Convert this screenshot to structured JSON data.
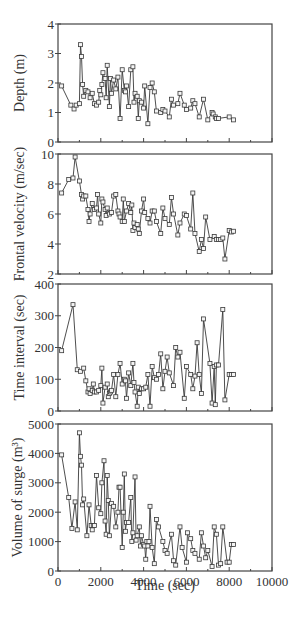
{
  "chart_data": [
    {
      "type": "line",
      "title": "",
      "xlabel": "",
      "ylabel": "Depth (m)",
      "xlim": [
        0,
        10000
      ],
      "ylim": [
        0,
        4
      ],
      "yticks": [
        0,
        1,
        2,
        3,
        4
      ],
      "grid": false,
      "marker": "square",
      "x": [
        170,
        600,
        750,
        850,
        1000,
        1050,
        1100,
        1150,
        1200,
        1300,
        1400,
        1500,
        1600,
        1700,
        1800,
        1900,
        1950,
        2000,
        2050,
        2100,
        2200,
        2250,
        2300,
        2400,
        2450,
        2500,
        2600,
        2700,
        2800,
        2900,
        3000,
        3100,
        3150,
        3200,
        3300,
        3400,
        3500,
        3550,
        3600,
        3700,
        3750,
        3800,
        3900,
        4000,
        4050,
        4200,
        4300,
        4400,
        4500,
        4600,
        4800,
        4900,
        5000,
        5200,
        5300,
        5400,
        5600,
        5700,
        5900,
        6000,
        6200,
        6300,
        6400,
        6600,
        6800,
        7000,
        7200,
        7250,
        7350,
        7400,
        7500,
        8000,
        8200
      ],
      "values": [
        1.9,
        1.25,
        1.12,
        1.25,
        1.3,
        3.3,
        2.9,
        1.95,
        1.55,
        1.75,
        1.7,
        1.5,
        1.65,
        1.3,
        1.25,
        1.35,
        1.75,
        1.6,
        1.95,
        2.35,
        2.15,
        1.5,
        2.6,
        1.2,
        2.15,
        1.65,
        2.1,
        1.8,
        2.2,
        0.8,
        2.45,
        1.75,
        1.7,
        1.9,
        1.2,
        2.45,
        2.55,
        1.35,
        1.65,
        1.55,
        0.8,
        1.4,
        1.35,
        1.15,
        1.9,
        0.62,
        1.85,
        2.0,
        1.7,
        1.05,
        1.0,
        1.1,
        1.05,
        0.85,
        1.45,
        1.25,
        1.3,
        1.65,
        1.25,
        1.1,
        1.15,
        1.4,
        1.3,
        0.85,
        1.45,
        0.75,
        1.0,
        0.95,
        0.85,
        0.8,
        0.8,
        0.85,
        0.75
      ]
    },
    {
      "type": "line",
      "xlabel": "",
      "ylabel": "Frontal velocity (m/sec)",
      "xlim": [
        0,
        10000
      ],
      "ylim": [
        2,
        10
      ],
      "yticks": [
        2,
        4,
        6,
        8,
        10
      ],
      "grid": false,
      "marker": "square",
      "x": [
        170,
        500,
        700,
        800,
        1000,
        1100,
        1150,
        1200,
        1300,
        1400,
        1450,
        1500,
        1600,
        1700,
        1800,
        1850,
        1900,
        2000,
        2050,
        2100,
        2200,
        2250,
        2300,
        2400,
        2500,
        2600,
        2700,
        2800,
        2850,
        2900,
        3000,
        3050,
        3100,
        3200,
        3300,
        3400,
        3450,
        3500,
        3550,
        3600,
        3700,
        3750,
        3800,
        3900,
        4000,
        4050,
        4200,
        4300,
        4400,
        4500,
        4600,
        4800,
        4900,
        5000,
        5200,
        5300,
        5400,
        5600,
        5700,
        5900,
        6000,
        6200,
        6300,
        6400,
        6600,
        6700,
        6800,
        6900,
        7100,
        7300,
        7400,
        7500,
        7600,
        7700,
        7800,
        8000,
        8100,
        8200
      ],
      "values": [
        7.4,
        8.3,
        8.4,
        9.8,
        8.2,
        7.3,
        7.0,
        7.2,
        7.2,
        6.3,
        5.5,
        6.0,
        6.7,
        6.3,
        6.4,
        7.3,
        6.0,
        5.4,
        7.0,
        6.8,
        6.3,
        5.9,
        6.4,
        6.0,
        6.1,
        7.2,
        7.3,
        6.2,
        6.0,
        5.8,
        5.5,
        7.0,
        5.5,
        6.2,
        6.7,
        6.1,
        6.6,
        4.9,
        5.4,
        5.1,
        5.3,
        5.0,
        4.7,
        6.2,
        7.0,
        6.1,
        5.7,
        5.4,
        6.2,
        6.2,
        5.5,
        4.7,
        6.4,
        5.7,
        5.3,
        7.1,
        6.0,
        4.6,
        5.4,
        6.0,
        5.9,
        5.0,
        7.4,
        4.7,
        3.5,
        4.3,
        3.7,
        5.8,
        4.3,
        4.5,
        4.3,
        4.3,
        4.3,
        4.4,
        3.0,
        4.9,
        4.8,
        4.85
      ]
    },
    {
      "type": "line",
      "xlabel": "",
      "ylabel": "Time interval (sec)",
      "xlim": [
        0,
        10000
      ],
      "ylim": [
        0,
        400
      ],
      "yticks": [
        0,
        100,
        200,
        300,
        400
      ],
      "grid": false,
      "marker": "square",
      "x": [
        170,
        700,
        900,
        1050,
        1200,
        1300,
        1400,
        1450,
        1500,
        1600,
        1650,
        1700,
        1800,
        1900,
        2000,
        2050,
        2100,
        2200,
        2300,
        2350,
        2400,
        2450,
        2500,
        2600,
        2700,
        2800,
        2900,
        3000,
        3100,
        3150,
        3200,
        3300,
        3400,
        3500,
        3550,
        3600,
        3700,
        3750,
        3800,
        3900,
        4000,
        4100,
        4200,
        4300,
        4400,
        4500,
        4600,
        4700,
        4800,
        4900,
        5000,
        5100,
        5200,
        5400,
        5500,
        5600,
        5700,
        5900,
        6000,
        6200,
        6300,
        6400,
        6500,
        6600,
        6700,
        6800,
        7100,
        7200,
        7300,
        7350,
        7400,
        7500,
        7700,
        7800,
        8000,
        8100,
        8200
      ],
      "values": [
        190,
        335,
        130,
        125,
        135,
        95,
        60,
        70,
        55,
        65,
        85,
        60,
        60,
        65,
        80,
        135,
        25,
        75,
        85,
        45,
        55,
        60,
        65,
        115,
        45,
        115,
        150,
        85,
        100,
        95,
        40,
        120,
        80,
        150,
        90,
        60,
        15,
        75,
        55,
        70,
        70,
        75,
        115,
        15,
        140,
        105,
        100,
        115,
        180,
        70,
        125,
        170,
        120,
        80,
        200,
        170,
        185,
        40,
        140,
        115,
        70,
        110,
        215,
        115,
        55,
        290,
        150,
        25,
        140,
        20,
        145,
        145,
        320,
        35,
        115,
        115,
        115
      ]
    },
    {
      "type": "line",
      "xlabel": "Time (sec)",
      "ylabel": "Volume of surge (m³)",
      "xlim": [
        0,
        10000
      ],
      "xticks": [
        0,
        2000,
        4000,
        6000,
        8000,
        10000
      ],
      "ylim": [
        0,
        5000
      ],
      "yticks": [
        0,
        1000,
        2000,
        3000,
        4000,
        5000
      ],
      "grid": false,
      "marker": "square",
      "x": [
        170,
        500,
        650,
        800,
        900,
        1000,
        1050,
        1100,
        1150,
        1200,
        1350,
        1450,
        1550,
        1600,
        1650,
        1700,
        1800,
        1900,
        2000,
        2050,
        2150,
        2200,
        2250,
        2300,
        2350,
        2400,
        2500,
        2600,
        2700,
        2800,
        2850,
        2900,
        3000,
        3050,
        3100,
        3150,
        3200,
        3300,
        3400,
        3450,
        3500,
        3600,
        3650,
        3700,
        3800,
        3850,
        3900,
        4000,
        4050,
        4100,
        4150,
        4200,
        4250,
        4300,
        4400,
        4500,
        4600,
        4700,
        4900,
        5000,
        5100,
        5300,
        5400,
        5500,
        5700,
        5800,
        6000,
        6050,
        6200,
        6300,
        6400,
        6600,
        6700,
        6800,
        6900,
        7000,
        7200,
        7300,
        7400,
        7500,
        7600,
        7700,
        7900,
        8000,
        8100,
        8200
      ],
      "values": [
        3950,
        2500,
        1450,
        2350,
        1400,
        4700,
        3900,
        3600,
        2250,
        2450,
        1200,
        2250,
        1550,
        1400,
        1550,
        1550,
        3250,
        2150,
        1950,
        3000,
        3750,
        1700,
        1250,
        3250,
        2400,
        1200,
        2300,
        2200,
        1500,
        2000,
        2850,
        2850,
        800,
        2000,
        3300,
        1350,
        1650,
        1650,
        2500,
        1000,
        1300,
        3200,
        1050,
        1200,
        1500,
        850,
        1200,
        900,
        850,
        400,
        1000,
        850,
        1000,
        2200,
        800,
        250,
        1750,
        1500,
        1000,
        700,
        600,
        1250,
        350,
        200,
        1500,
        800,
        300,
        1300,
        1100,
        700,
        600,
        400,
        1300,
        850,
        450,
        700,
        150,
        1500,
        1250,
        200,
        250,
        1500,
        300,
        300,
        900,
        900
      ]
    }
  ],
  "figure": {
    "panels": [
      {
        "ylabel": "Depth (m)",
        "ytick_labels": [
          "0",
          "1",
          "2",
          "3",
          "4"
        ]
      },
      {
        "ylabel": "Frontal velocity (m/sec)",
        "ytick_labels": [
          "2",
          "4",
          "6",
          "8",
          "10"
        ]
      },
      {
        "ylabel": "Time interval (sec)",
        "ytick_labels": [
          "0",
          "100",
          "200",
          "300",
          "400"
        ]
      },
      {
        "ylabel": "Volume of surge (m³)",
        "ytick_labels": [
          "0",
          "1000",
          "2000",
          "3000",
          "4000",
          "5000"
        ]
      }
    ],
    "xlabel": "Time (sec)",
    "xtick_labels": [
      "0",
      "2000",
      "4000",
      "6000",
      "8000",
      "10000"
    ]
  },
  "colors": {
    "line": "#3a3a3a",
    "marker_fill": "#f4f4f4",
    "axis": "#444444",
    "text": "#333333"
  }
}
